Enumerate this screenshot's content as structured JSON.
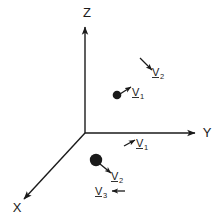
{
  "figure": {
    "type": "3d-axis-vector-diagram",
    "background_color": "#ffffff",
    "ink_color": "#1a1a1a",
    "axes": {
      "z_label": "Z",
      "y_label": "Y",
      "x_label": "X"
    },
    "vectors": [
      {
        "id": "v1-upper",
        "label": "V",
        "subscript": "1",
        "direction": "up-right",
        "attached_to": "upper-particle"
      },
      {
        "id": "v2-upper-right",
        "label": "V",
        "subscript": "2",
        "direction": "down-right",
        "attached_to": "free"
      },
      {
        "id": "v1-y-axis",
        "label": "V",
        "subscript": "1",
        "direction": "up-right",
        "attached_to": "free"
      },
      {
        "id": "v2-lower",
        "label": "V",
        "subscript": "2",
        "direction": "down-right",
        "attached_to": "lower-particle"
      },
      {
        "id": "v3-lower",
        "label": "V",
        "subscript": "3",
        "direction": "left",
        "attached_to": "free"
      }
    ],
    "particles": [
      {
        "id": "upper-particle",
        "size": "small"
      },
      {
        "id": "lower-particle",
        "size": "large"
      }
    ]
  }
}
